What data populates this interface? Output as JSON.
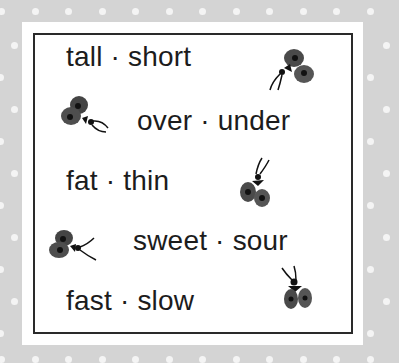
{
  "card": {
    "rows": [
      {
        "text": "tall · short"
      },
      {
        "text": "over · under"
      },
      {
        "text": "fat · thin"
      },
      {
        "text": "sweet · sour"
      },
      {
        "text": "fast · slow"
      }
    ]
  },
  "icons": [
    "bug-icon",
    "bug-icon",
    "bug-icon",
    "bug-icon",
    "bug-icon"
  ],
  "colors": {
    "background": "#d4d4d4",
    "dots": "#f4f4f4",
    "panel": "#ffffff",
    "frame": "#2a2a2a",
    "text": "#1c1c1c",
    "bug_wing": "#4a4a4a"
  }
}
